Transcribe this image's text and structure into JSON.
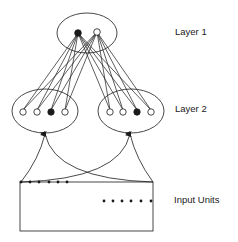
{
  "labels": {
    "layer1": "Layer 1",
    "layer2": "Layer 2",
    "input": "Input Units"
  },
  "colors": {
    "stroke": "#1a1a1a",
    "background": "#ffffff"
  },
  "layer1": {
    "ellipse": {
      "cx": 87,
      "cy": 33,
      "rx": 30,
      "ry": 20
    },
    "nodes": [
      {
        "x": 78,
        "y": 33,
        "filled": true
      },
      {
        "x": 97,
        "y": 32,
        "filled": false
      }
    ]
  },
  "layer2": {
    "groups": [
      {
        "ellipse": {
          "cx": 45,
          "cy": 111,
          "rx": 33,
          "ry": 22
        },
        "nodes": [
          {
            "x": 23,
            "y": 112,
            "filled": false
          },
          {
            "x": 37,
            "y": 112,
            "filled": false
          },
          {
            "x": 51,
            "y": 112,
            "filled": true
          },
          {
            "x": 65,
            "y": 112,
            "filled": false
          }
        ],
        "arrow": {
          "x": 45,
          "y": 134
        }
      },
      {
        "ellipse": {
          "cx": 131,
          "cy": 111,
          "rx": 33,
          "ry": 22
        },
        "nodes": [
          {
            "x": 110,
            "y": 112,
            "filled": false
          },
          {
            "x": 123,
            "y": 112,
            "filled": false
          },
          {
            "x": 137,
            "y": 112,
            "filled": true
          },
          {
            "x": 151,
            "y": 112,
            "filled": false
          }
        ],
        "arrow": {
          "x": 130,
          "y": 134
        }
      }
    ]
  },
  "input": {
    "rect": {
      "x": 20,
      "y": 182,
      "w": 133,
      "h": 49
    },
    "dots_top_left": [
      21,
      30,
      39,
      49,
      58,
      67
    ],
    "dots_top_y": 182,
    "dots_right": [
      104,
      113,
      122,
      131,
      141,
      151
    ],
    "dots_right_y": 201
  }
}
